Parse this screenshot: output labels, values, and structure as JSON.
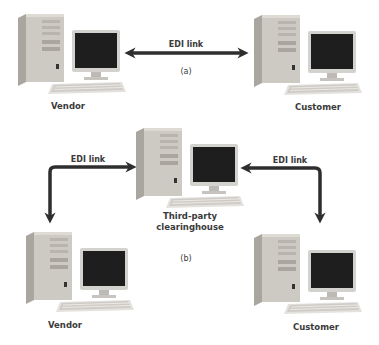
{
  "diagram": {
    "part_a": {
      "caption": "(a)",
      "link_label": "EDI link",
      "left_node": {
        "label": "Vendor",
        "icon": "desktop-computer-icon"
      },
      "right_node": {
        "label": "Customer",
        "icon": "desktop-computer-icon"
      },
      "connection": "bidirectional-arrow"
    },
    "part_b": {
      "caption": "(b)",
      "hub_node": {
        "label_line1": "Third-party",
        "label_line2": "clearinghouse",
        "icon": "desktop-computer-icon"
      },
      "left_link_label": "EDI link",
      "right_link_label": "EDI link",
      "left_node": {
        "label": "Vendor",
        "icon": "desktop-computer-icon"
      },
      "right_node": {
        "label": "Customer",
        "icon": "desktop-computer-icon"
      },
      "connection": "bidirectional-elbow-arrows"
    },
    "colors": {
      "arrow": "#2e2e2e",
      "text": "#3a3a3a",
      "tower": "#c9c5c0",
      "screen": "#1e1e1e"
    }
  }
}
